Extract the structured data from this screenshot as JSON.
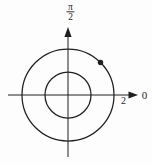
{
  "figure": {
    "background_color": "#fdfdfd",
    "ink_color": "#1f1f1f",
    "labels": {
      "vertical_axis_fraction": {
        "numerator": "π",
        "denominator": "2"
      },
      "polar_axis": "0",
      "radius_tick": "2"
    }
  },
  "chart_data": {
    "type": "scatter",
    "coordinate_system": "polar",
    "title": "",
    "grid_circle_radii": [
      1,
      2
    ],
    "axis_rays": [
      {
        "angle_degrees": 0,
        "label": "0"
      },
      {
        "angle_degrees": 90,
        "label": "π/2"
      }
    ],
    "tick_labels": [
      {
        "axis": "polar",
        "value": 2,
        "label": "2"
      }
    ],
    "points": [
      {
        "r": 2,
        "theta": "π/4",
        "theta_degrees": 45
      }
    ]
  }
}
